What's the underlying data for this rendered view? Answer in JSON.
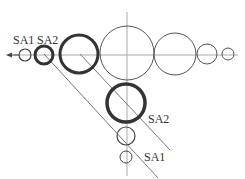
{
  "diagram": {
    "labels": {
      "sa1_top": "SA1",
      "sa2_top": "SA2",
      "sa2_bottom": "SA2",
      "sa1_bottom": "SA1"
    },
    "colors": {
      "stroke": "#444444",
      "axis": "#999999",
      "background": "#ffffff"
    }
  }
}
